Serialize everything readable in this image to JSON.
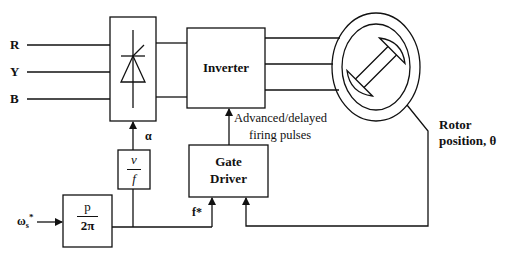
{
  "diagram": {
    "inputs": {
      "phases": [
        "R",
        "Y",
        "B"
      ],
      "speed_ref": "ω",
      "speed_ref_sub": "s",
      "speed_ref_sup": "*"
    },
    "blocks": {
      "rectifier": {
        "symbol": "thyristor-icon"
      },
      "inverter": {
        "label": "Inverter"
      },
      "gate_driver": {
        "label_line1": "Gate",
        "label_line2": "Driver"
      },
      "v_f": {
        "num": "v",
        "den": "f"
      },
      "p_2pi": {
        "num": "p",
        "den": "2π"
      },
      "motor": {
        "symbol": "salient-rotor-icon"
      }
    },
    "signals": {
      "alpha": "α",
      "f_star": "f*",
      "firing_line1": "Advanced/delayed",
      "firing_line2": "firing pulses",
      "rotor_line1": "Rotor",
      "rotor_line2": "position, θ"
    },
    "colors": {
      "stroke": "#111111",
      "background": "#ffffff"
    }
  }
}
